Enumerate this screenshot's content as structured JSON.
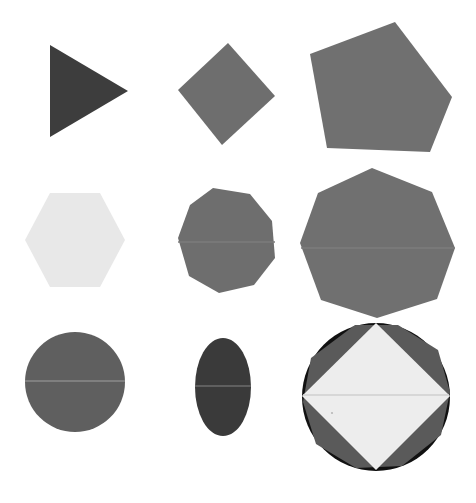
{
  "page": {
    "width": 476,
    "height": 503,
    "background_color": "#ffffff"
  },
  "palette": {
    "background": "#ffffff",
    "very_dark": "#111111",
    "dark_gray": "#3d3d3d",
    "darker_gray": "#3a3a3a",
    "medium_gray": "#6e6e6e",
    "mid_gray": "#5f5f5f",
    "slate_gray": "#707070",
    "light_gray": "#e8e8e8",
    "off_white": "#ededed",
    "highlight_line": "#8a8a8a"
  },
  "grid": {
    "rows": 3,
    "columns": 3,
    "cell_count": 9
  },
  "shapes": [
    {
      "id": "shape-1",
      "name": "triangle",
      "label": "Triangle",
      "row": 1,
      "column": 1,
      "sides": 3,
      "fill": "#3d3d3d",
      "orientation": "pointing-right",
      "rotation_deg": -90,
      "bbox": {
        "x": 50,
        "y": 45,
        "width": 78,
        "height": 92
      },
      "center": {
        "x": 89,
        "y": 91
      },
      "points": "50,45 128,91 50,137"
    },
    {
      "id": "shape-2",
      "name": "diamond",
      "label": "Diamond",
      "row": 1,
      "column": 2,
      "sides": 4,
      "fill": "#6e6e6e",
      "orientation": "rotated-square",
      "rotation_deg": 45,
      "bbox": {
        "x": 178,
        "y": 43,
        "width": 97,
        "height": 102
      },
      "center": {
        "x": 226,
        "y": 94
      },
      "points": "228,43 275,96 222,145 178,90"
    },
    {
      "id": "shape-3",
      "name": "pentagon",
      "label": "Pentagon",
      "row": 1,
      "column": 3,
      "sides": 5,
      "fill": "#707070",
      "orientation": "rotated",
      "rotation_deg": 20,
      "bbox": {
        "x": 310,
        "y": 22,
        "width": 142,
        "height": 130
      },
      "center": {
        "x": 381,
        "y": 87
      },
      "points": "395,22 452,97 430,152 327,148 310,54"
    },
    {
      "id": "shape-4",
      "name": "hexagon",
      "label": "Hexagon",
      "row": 2,
      "column": 1,
      "sides": 6,
      "fill": "#e8e8e8",
      "orientation": "flat-top",
      "rotation_deg": 0,
      "bbox": {
        "x": 25,
        "y": 193,
        "width": 100,
        "height": 94
      },
      "center": {
        "x": 75,
        "y": 240
      },
      "points": "50,193 100,193 125,240 100,287 50,287 25,240"
    },
    {
      "id": "shape-5",
      "name": "octagon",
      "label": "Octagon",
      "row": 2,
      "column": 2,
      "sides": 8,
      "fill": "#6e6e6e",
      "orientation": "rotated",
      "rotation_deg": 10,
      "bbox": {
        "x": 178,
        "y": 188,
        "width": 97,
        "height": 105
      },
      "center": {
        "x": 226,
        "y": 240
      },
      "points": "213,188 250,194 272,221 275,258 254,285 219,293 189,276 178,238 190,205"
    },
    {
      "id": "shape-6",
      "name": "large-octagon",
      "label": "Large Octagon",
      "row": 2,
      "column": 3,
      "sides": 8,
      "fill": "#707070",
      "orientation": "rotated",
      "rotation_deg": 8,
      "bbox": {
        "x": 300,
        "y": 168,
        "width": 155,
        "height": 150
      },
      "center": {
        "x": 377,
        "y": 243
      },
      "points": "372,168 432,192 455,248 437,299 377,318 321,300 300,243 318,193"
    },
    {
      "id": "shape-7",
      "name": "circle",
      "label": "Circle",
      "row": 3,
      "column": 1,
      "sides": 0,
      "fill": "#5f5f5f",
      "orientation": "none",
      "rotation_deg": 0,
      "bbox": {
        "x": 25,
        "y": 333,
        "width": 100,
        "height": 99
      },
      "center": {
        "x": 75,
        "y": 382
      },
      "radius_x": 50,
      "radius_y": 50,
      "has_highlight_line": true,
      "highlight_line_y": 382
    },
    {
      "id": "shape-8",
      "name": "ellipse",
      "label": "Ellipse",
      "row": 3,
      "column": 2,
      "sides": 0,
      "fill": "#3a3a3a",
      "orientation": "vertical",
      "rotation_deg": 0,
      "bbox": {
        "x": 195,
        "y": 338,
        "width": 55,
        "height": 97
      },
      "center": {
        "x": 223,
        "y": 387
      },
      "radius_x": 28,
      "radius_y": 49,
      "has_highlight_line": true,
      "highlight_line_y": 386
    },
    {
      "id": "shape-9",
      "name": "composite-circle-octagon-diamond",
      "label": "Composite: Circle with Octagon and Diamond",
      "row": 3,
      "column": 3,
      "sides": 0,
      "orientation": "layered",
      "rotation_deg": 0,
      "bbox": {
        "x": 302,
        "y": 322,
        "width": 148,
        "height": 150
      },
      "center": {
        "x": 376,
        "y": 397
      },
      "layers": [
        {
          "name": "outer-circle",
          "shape": "circle",
          "fill": "#111111",
          "radius": 74
        },
        {
          "name": "inner-octagon",
          "shape": "octagon",
          "fill": "#5a5a5a"
        },
        {
          "name": "top-diamond",
          "shape": "diamond",
          "fill": "#ededed"
        }
      ],
      "has_highlight_line": true,
      "highlight_line_y": 397
    }
  ]
}
